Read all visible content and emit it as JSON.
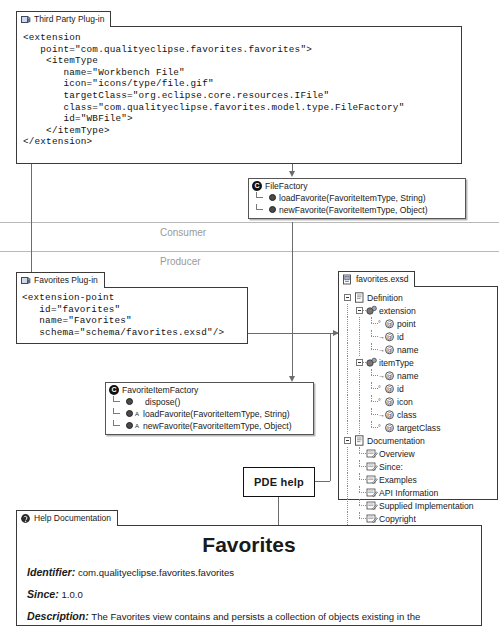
{
  "thirdparty": {
    "tab_label": "Third Party Plug-in",
    "tab_icon": "plugin-icon",
    "code": "<extension\n   point=\"com.qualityeclipse.favorites.favorites\">\n    <itemType\n       name=\"Workbench File\"\n       icon=\"icons/type/file.gif\"\n       targetClass=\"org.eclipse.core.resources.IFile\"\n       class=\"com.qualityeclipse.favorites.model.type.FileFactory\"\n       id=\"WBFile\">\n    </itemType>\n</extension>"
  },
  "filefactory": {
    "icon": "class-icon",
    "title": "FileFactory",
    "members": [
      "loadFavorite(FavoriteItemType, String)",
      "newFavorite(FavoriteItemType, Object)"
    ]
  },
  "lanes": {
    "consumer": "Consumer",
    "producer": "Producer"
  },
  "favplugin": {
    "tab_label": "Favorites Plug-in",
    "tab_icon": "plugin-icon",
    "code": "<extension-point\n   id=\"favorites\"\n   name=\"Favorites\"\n   schema=\"schema/favorites.exsd\"/>"
  },
  "favitemfactory": {
    "icon": "class-icon",
    "title": "FavoriteItemFactory",
    "members": [
      {
        "name": "dispose()",
        "abstract": ""
      },
      {
        "name": "loadFavorite(FavoriteItemType, String)",
        "abstract": "A"
      },
      {
        "name": "newFavorite(FavoriteItemType, Object)",
        "abstract": "A"
      }
    ]
  },
  "exsd": {
    "tab_label": "favorites.exsd",
    "tab_icon": "schema-file-icon",
    "tree": [
      {
        "label": "Definition",
        "depth": 0,
        "icon": "document-icon",
        "expander": "minus"
      },
      {
        "label": "extension",
        "depth": 1,
        "icon": "element-icon",
        "expander": "minus"
      },
      {
        "label": "point",
        "depth": 2,
        "icon": "attribute-icon",
        "expander": "none",
        "badge": "optional"
      },
      {
        "label": "id",
        "depth": 2,
        "icon": "attribute-icon",
        "expander": "none",
        "badge": "required"
      },
      {
        "label": "name",
        "depth": 2,
        "icon": "attribute-icon",
        "expander": "none",
        "badge": "required"
      },
      {
        "label": "itemType",
        "depth": 1,
        "icon": "element-icon",
        "expander": "minus"
      },
      {
        "label": "name",
        "depth": 2,
        "icon": "attribute-icon",
        "expander": "none",
        "badge": "required"
      },
      {
        "label": "id",
        "depth": 2,
        "icon": "attribute-icon",
        "expander": "none",
        "badge": "optional"
      },
      {
        "label": "icon",
        "depth": 2,
        "icon": "attribute-icon",
        "expander": "none",
        "badge": "optional"
      },
      {
        "label": "class",
        "depth": 2,
        "icon": "attribute-icon",
        "expander": "none",
        "badge": "required"
      },
      {
        "label": "targetClass",
        "depth": 2,
        "icon": "attribute-icon",
        "expander": "none",
        "badge": "optional"
      },
      {
        "label": "Documentation",
        "depth": 0,
        "icon": "document-icon",
        "expander": "minus"
      },
      {
        "label": "Overview",
        "depth": 1,
        "icon": "doc-section-icon",
        "expander": "none"
      },
      {
        "label": "Since:",
        "depth": 1,
        "icon": "doc-section-icon",
        "expander": "none"
      },
      {
        "label": "Examples",
        "depth": 1,
        "icon": "doc-section-icon",
        "expander": "none"
      },
      {
        "label": "API Information",
        "depth": 1,
        "icon": "doc-section-icon",
        "expander": "none"
      },
      {
        "label": "Supplied Implementation",
        "depth": 1,
        "icon": "doc-section-icon",
        "expander": "none"
      },
      {
        "label": "Copyright",
        "depth": 1,
        "icon": "doc-section-icon",
        "expander": "none"
      }
    ]
  },
  "pde": {
    "label": "PDE help"
  },
  "help": {
    "tab_label": "Help Documentation",
    "tab_icon": "help-icon",
    "title": "Favorites",
    "rows": [
      {
        "label": "Identifier:",
        "value": "com.qualityeclipse.favorites.favorites"
      },
      {
        "label": "Since:",
        "value": "1.0.0"
      },
      {
        "label": "Description:",
        "value": "The Favorites view contains and persists a collection of objects existing in the"
      }
    ]
  }
}
